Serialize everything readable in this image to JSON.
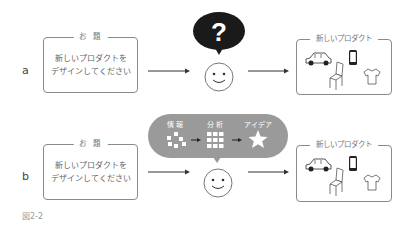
{
  "rows": [
    {
      "label": "a",
      "task_box": {
        "title": "お 題",
        "lines": [
          "新しいプロダクトを",
          "デザインしてください"
        ]
      },
      "thought": {
        "type": "question-bubble",
        "symbol": "?",
        "color": "#1a1a1a"
      },
      "result_box": {
        "title": "新しいプロダクト",
        "icons": [
          "car-icon",
          "chair-icon",
          "smartphone-icon",
          "tshirt-icon"
        ]
      }
    },
    {
      "label": "b",
      "task_box": {
        "title": "お 題",
        "lines": [
          "新しいプロダクトを",
          "デザインしてください"
        ]
      },
      "thought": {
        "type": "process-bubble",
        "color": "#9a9a9a",
        "steps": [
          {
            "label": "情 報",
            "icon": "scattered-squares-icon"
          },
          {
            "label": "分 析",
            "icon": "grid-squares-icon"
          },
          {
            "label": "アイデア",
            "icon": "star-icon"
          }
        ]
      },
      "result_box": {
        "title": "新しいプロダクト",
        "icons": [
          "car-icon",
          "chair-icon",
          "smartphone-icon",
          "tshirt-icon"
        ]
      }
    }
  ],
  "caption": "図2-2"
}
